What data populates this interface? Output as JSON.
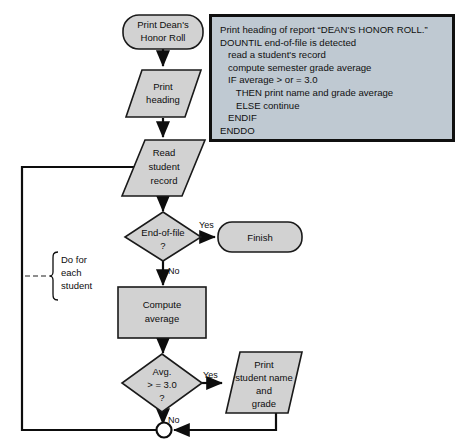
{
  "diagram": {
    "colors": {
      "shape_fill": "#d2d2d2",
      "shape_stroke": "#0d0d0d",
      "pseudocode_fill": "#bfc9d2",
      "pseudocode_border": "#101010",
      "page_background": "#ffffff"
    }
  },
  "pseudocode": {
    "lines": [
      "Print heading of report “DEAN'S HONOR ROLL.”",
      "DOUNTIL end-of-file is detected",
      "   read a student's record",
      "   compute semester grade average",
      "   IF average > or = 3.0",
      "      THEN print name and grade average",
      "      ELSE continue",
      "   ENDIF",
      "ENDDO"
    ]
  },
  "nodes": {
    "start_terminal": {
      "line1": "Print Dean's",
      "line2": "Honor Roll"
    },
    "print_heading": {
      "line1": "Print",
      "line2": "heading"
    },
    "read_student_record": {
      "line1": "Read",
      "line2": "student",
      "line3": "record"
    },
    "end_of_file_decision": {
      "line1": "End-of-file",
      "line2": "?"
    },
    "finish_terminal": {
      "label": "Finish"
    },
    "compute_average": {
      "line1": "Compute",
      "line2": "average"
    },
    "average_decision": {
      "line1": "Avg.",
      "line2": "> = 3.0",
      "line3": "?"
    },
    "print_student": {
      "line1": "Print",
      "line2": "student name",
      "line3": "and",
      "line4": "grade"
    }
  },
  "edge_labels": {
    "eof_yes": "Yes",
    "eof_no": "No",
    "avg_yes": "Yes",
    "avg_no": "No"
  },
  "annotation": {
    "bracket_label": {
      "line1": "Do for",
      "line2": "each",
      "line3": "student"
    }
  }
}
